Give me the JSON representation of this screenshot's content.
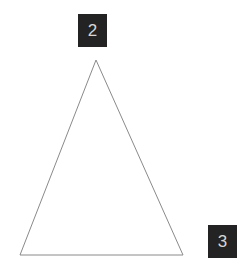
{
  "canvas": {
    "width": 241,
    "height": 274,
    "background_color": "#ffffff"
  },
  "diagram": {
    "type": "geometric-shape-annotation",
    "shape_name": "triangle",
    "stroke_color": "#8a8a8a",
    "stroke_width": 1,
    "fill": "none",
    "vertices": [
      {
        "name": "apex",
        "x": 96,
        "y": 60
      },
      {
        "name": "bottom-right",
        "x": 183,
        "y": 255
      },
      {
        "name": "bottom-left",
        "x": 20,
        "y": 255
      }
    ],
    "points_attribute": "96,60 183,255 20,255"
  },
  "labels": [
    {
      "id": "label-2",
      "text": "2",
      "background_color": "#232323",
      "text_color": "#d6d6d6",
      "x": 78,
      "y": 14,
      "width": 29,
      "height": 33,
      "anchor": "above-apex"
    },
    {
      "id": "label-3",
      "text": "3",
      "background_color": "#232323",
      "text_color": "#d6d6d6",
      "x": 208,
      "y": 225,
      "width": 29,
      "height": 33,
      "anchor": "right-of-bottom-right-vertex"
    }
  ]
}
